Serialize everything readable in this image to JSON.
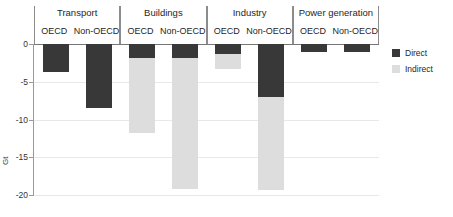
{
  "chart_data": {
    "type": "bar",
    "title": "",
    "xlabel": "",
    "ylabel": "Gt",
    "ylim": [
      -20,
      0
    ],
    "grid": true,
    "stacked": true,
    "orientation": "vertical",
    "legend_position": "right",
    "y_unit_label": "Gt",
    "y_ticks": [
      "0",
      "-5",
      "-10",
      "-15",
      "-20"
    ],
    "y_tick_values": [
      0,
      -5,
      -10,
      -15,
      -20
    ],
    "groups": [
      {
        "label": "Transport",
        "subcategories": [
          "OECD",
          "Non-OECD"
        ]
      },
      {
        "label": "Buildings",
        "subcategories": [
          "OECD",
          "Non-OECD"
        ]
      },
      {
        "label": "Industry",
        "subcategories": [
          "OECD",
          "Non-OECD"
        ]
      },
      {
        "label": "Power generation",
        "subcategories": [
          "OECD",
          "Non-OECD"
        ]
      }
    ],
    "categories": [
      "Transport OECD",
      "Transport Non-OECD",
      "Buildings OECD",
      "Buildings Non-OECD",
      "Industry OECD",
      "Industry Non-OECD",
      "Power generation OECD",
      "Power generation Non-OECD"
    ],
    "series": [
      {
        "name": "Direct",
        "color": "#383838",
        "values": [
          -3.7,
          -8.5,
          -1.9,
          -1.9,
          -1.3,
          -7.0,
          -1.1,
          -1.1
        ]
      },
      {
        "name": "Indirect",
        "color": "#dddddd",
        "values": [
          0.0,
          0.0,
          -9.9,
          -17.3,
          -2.0,
          -12.3,
          0.0,
          0.0
        ]
      }
    ],
    "totals": [
      -3.7,
      -8.5,
      -11.8,
      -19.2,
      -3.3,
      -19.3,
      -1.1,
      -1.1
    ]
  },
  "legend": {
    "items": [
      {
        "label": "Direct",
        "color": "#383838"
      },
      {
        "label": "Indirect",
        "color": "#dddddd"
      }
    ]
  }
}
